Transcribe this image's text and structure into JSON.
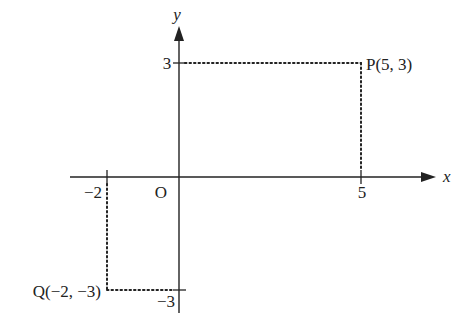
{
  "diagram": {
    "type": "coordinate-plane",
    "axes": {
      "x_label": "x",
      "y_label": "y",
      "origin_label": "O"
    },
    "ticks": {
      "x_pos": "5",
      "x_neg": "−2",
      "y_pos": "3",
      "y_neg": "−3"
    },
    "points": [
      {
        "name": "P",
        "x": 5,
        "y": 3,
        "label": "P(5, 3)"
      },
      {
        "name": "Q",
        "x": -2,
        "y": -3,
        "label": "Q(−2, −3)"
      }
    ],
    "colors": {
      "axis": "#222222",
      "dotted": "#222222",
      "background": "#ffffff"
    }
  }
}
